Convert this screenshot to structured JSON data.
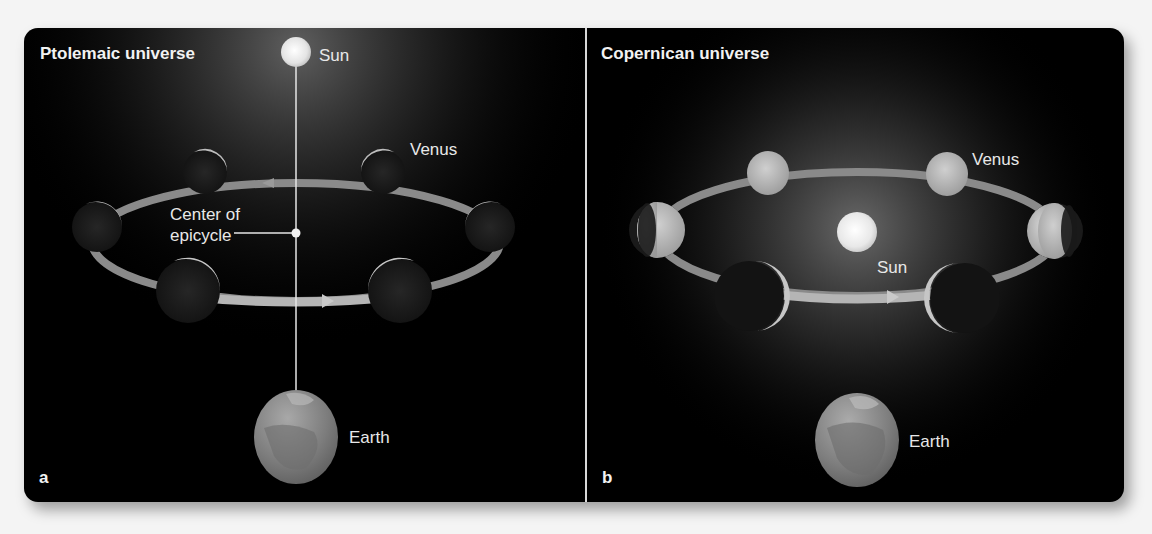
{
  "panels": [
    {
      "id": "a",
      "title": "Ptolemaic universe",
      "letter": "a",
      "labels": {
        "sun": "Sun",
        "venus": "Venus",
        "center_line1": "Center of",
        "center_line2": "epicycle",
        "earth": "Earth"
      }
    },
    {
      "id": "b",
      "title": "Copernican universe",
      "letter": "b",
      "labels": {
        "sun": "Sun",
        "venus": "Venus",
        "earth": "Earth"
      }
    }
  ],
  "colors": {
    "background": "#000000",
    "orbit": "#8a8a8a",
    "label": "#e8e8e8",
    "divider": "#d8d8d8"
  }
}
